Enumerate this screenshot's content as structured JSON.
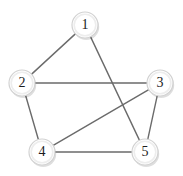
{
  "diagram": {
    "type": "node-link-graph",
    "background_color": "#ffffff",
    "edge_color": "#6b6b6b",
    "node_fill_color": "#ffffff",
    "node_border_color": "#d2d2d2",
    "node_label_color": "#1c1c1c",
    "node_radius": 13,
    "canvas": {
      "width": 183,
      "height": 176
    }
  },
  "nodes": [
    {
      "id": "1",
      "label": "1",
      "x": 85,
      "y": 25,
      "degree": 2
    },
    {
      "id": "2",
      "label": "2",
      "x": 22,
      "y": 83,
      "degree": 3
    },
    {
      "id": "3",
      "label": "3",
      "x": 160,
      "y": 83,
      "degree": 3
    },
    {
      "id": "4",
      "label": "4",
      "x": 42,
      "y": 152,
      "degree": 3
    },
    {
      "id": "5",
      "label": "5",
      "x": 145,
      "y": 152,
      "degree": 3
    }
  ],
  "edges": [
    {
      "id": "e1",
      "source": "1",
      "target": "2",
      "label": "1-2"
    },
    {
      "id": "e2",
      "source": "1",
      "target": "5",
      "label": "1-5"
    },
    {
      "id": "e3",
      "source": "2",
      "target": "3",
      "label": "2-3"
    },
    {
      "id": "e4",
      "source": "2",
      "target": "4",
      "label": "2-4"
    },
    {
      "id": "e5",
      "source": "3",
      "target": "4",
      "label": "3-4"
    },
    {
      "id": "e6",
      "source": "3",
      "target": "5",
      "label": "3-5"
    },
    {
      "id": "e7",
      "source": "4",
      "target": "5",
      "label": "4-5"
    }
  ],
  "summary": {
    "node_count": "5",
    "edge_count": "7"
  }
}
